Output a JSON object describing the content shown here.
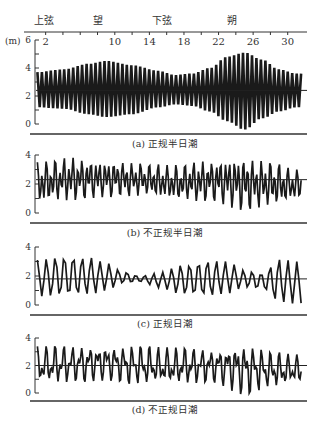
{
  "figure": {
    "moon_phases": [
      {
        "label": "上弦",
        "day": 1.5
      },
      {
        "label": "望",
        "day": 8.5
      },
      {
        "label": "下弦",
        "day": 16
      },
      {
        "label": "朔",
        "day": 24.5
      }
    ],
    "day_ticks": [
      2,
      10,
      14,
      18,
      22,
      26,
      30
    ],
    "y_unit": "(m)",
    "colors": {
      "ink": "#1a1a1a",
      "axis": "#333333",
      "text": "#333333"
    }
  },
  "chart_data": [
    {
      "type": "line",
      "id": "a",
      "title": "(a) 正规半日潮",
      "xlabel": "day of month",
      "ylabel": "(m)",
      "x_ticks": [
        2,
        10,
        14,
        18,
        22,
        26,
        30
      ],
      "xlim": [
        1,
        32
      ],
      "ylim": [
        0,
        6
      ],
      "y_ticks": [
        0,
        2,
        4,
        6
      ],
      "mean_level": 2.4,
      "pattern": "semidiurnal, two equal highs/lows per day, spring tides near full/new moon",
      "envelope": {
        "days": [
          1,
          4,
          7,
          9,
          12,
          15,
          17,
          19,
          21,
          23,
          25,
          27,
          29,
          31
        ],
        "high": [
          3.7,
          3.9,
          4.3,
          4.5,
          4.2,
          3.8,
          3.5,
          3.6,
          4.0,
          4.8,
          5.1,
          4.6,
          3.9,
          3.6
        ],
        "low": [
          1.2,
          1.1,
          0.7,
          0.5,
          0.7,
          1.2,
          1.4,
          1.3,
          0.9,
          0.2,
          -0.4,
          0.4,
          0.9,
          1.2
        ]
      }
    },
    {
      "type": "line",
      "id": "b",
      "title": "(b) 不正规半日潮",
      "ylim": [
        0,
        4
      ],
      "y_ticks": [
        0,
        2,
        4
      ],
      "mean_level": 2.3,
      "pattern": "mixed, mainly semidiurnal with strong diurnal inequality",
      "envelope": {
        "days": [
          1,
          5,
          9,
          13,
          17,
          21,
          25,
          28,
          31
        ],
        "high": [
          3.5,
          3.8,
          3.6,
          3.4,
          3.3,
          3.6,
          3.8,
          3.5,
          3.0
        ],
        "low": [
          0.7,
          0.9,
          1.1,
          1.2,
          0.9,
          0.8,
          0.2,
          0.5,
          0.9
        ]
      }
    },
    {
      "type": "line",
      "id": "c",
      "title": "(c) 正规日潮",
      "ylim": [
        0,
        4
      ],
      "y_ticks": [
        0,
        2,
        4
      ],
      "mean_level": 1.8,
      "pattern": "diurnal, one high/low per day, neaps near equator crossings",
      "envelope": {
        "days": [
          1,
          4,
          7,
          9,
          11,
          13,
          15,
          18,
          21,
          23,
          25,
          27,
          29,
          31
        ],
        "high": [
          3.1,
          3.4,
          3.3,
          2.9,
          2.3,
          2.0,
          2.2,
          2.8,
          3.1,
          3.0,
          2.4,
          2.2,
          3.2,
          3.0
        ],
        "low": [
          0.6,
          0.6,
          0.7,
          1.0,
          1.5,
          1.6,
          1.2,
          0.7,
          0.6,
          0.8,
          1.2,
          1.1,
          0.2,
          0.1
        ]
      }
    },
    {
      "type": "line",
      "id": "d",
      "title": "(d) 不正规日潮",
      "ylim": [
        0,
        4
      ],
      "y_ticks": [
        0,
        2,
        4
      ],
      "mean_level": 2.0,
      "pattern": "mixed, mainly diurnal with semidiurnal episodes",
      "envelope": {
        "days": [
          1,
          5,
          9,
          13,
          17,
          21,
          25,
          28,
          31
        ],
        "high": [
          3.4,
          3.4,
          3.5,
          3.4,
          3.3,
          3.2,
          3.6,
          3.0,
          2.8
        ],
        "low": [
          0.6,
          0.8,
          0.9,
          0.6,
          0.6,
          0.8,
          -0.1,
          0.4,
          0.6
        ]
      }
    }
  ]
}
